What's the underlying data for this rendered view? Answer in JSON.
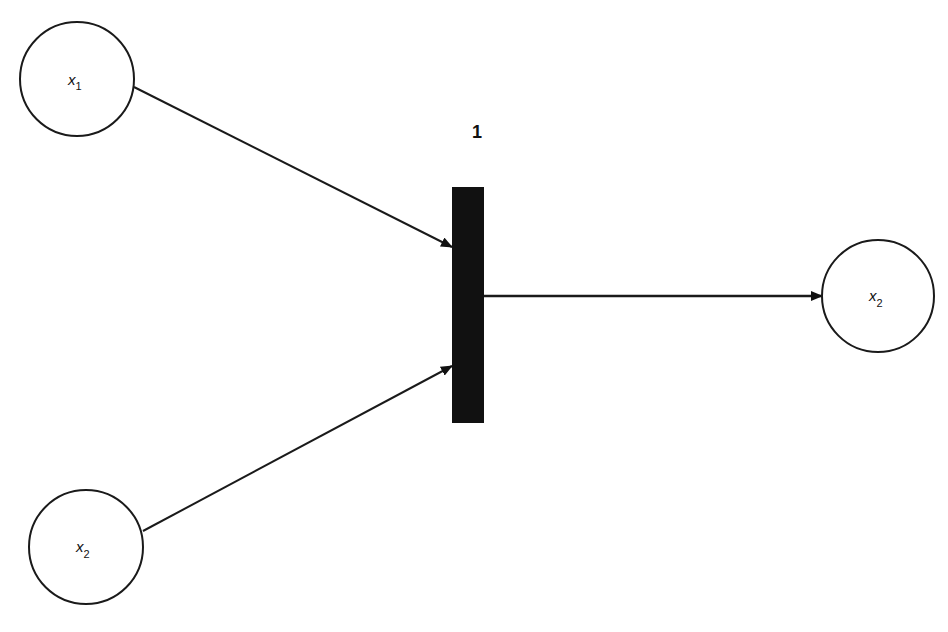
{
  "diagram": {
    "type": "petri-net",
    "places": [
      {
        "id": "p1",
        "var": "x",
        "sub": "1",
        "cx": 77,
        "cy": 79,
        "r": 57
      },
      {
        "id": "p2",
        "var": "x",
        "sub": "2",
        "cx": 86,
        "cy": 547,
        "r": 57
      },
      {
        "id": "p3",
        "var": "x",
        "sub": "2",
        "cx": 878,
        "cy": 296,
        "r": 56
      }
    ],
    "transition": {
      "label": "1",
      "x": 452,
      "y": 187,
      "width": 32,
      "height": 236
    },
    "arcs": [
      {
        "from": "p1",
        "to": "transition",
        "x1": 134,
        "y1": 87,
        "x2": 452,
        "y2": 247
      },
      {
        "from": "p2",
        "to": "transition",
        "x1": 143,
        "y1": 531,
        "x2": 452,
        "y2": 366
      },
      {
        "from": "transition",
        "to": "p3",
        "x1": 484,
        "y1": 296,
        "x2": 822,
        "y2": 296
      }
    ],
    "colors": {
      "stroke": "#1a1a1a",
      "fill": "#111111",
      "background": "#ffffff"
    }
  }
}
